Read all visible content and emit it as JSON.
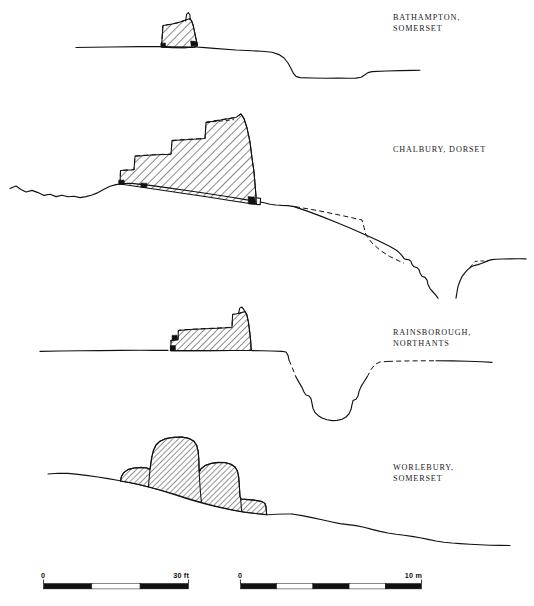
{
  "figure": {
    "type": "archaeological-cross-sections",
    "title_visible": false,
    "background_color": "#ffffff",
    "ink_color": "#111111"
  },
  "sections": [
    {
      "id": "bathampton",
      "label_line1": "BATHAMPTON,",
      "label_line2": "SOMERSET",
      "rampart_style": "trapezoidal-hatched",
      "has_dashed_reconstruction": true,
      "has_ditch": true,
      "ditch_style": "broad-flat-bottomed"
    },
    {
      "id": "chalbury",
      "label_line1": "CHALBURY, DORSET",
      "label_line2": "",
      "rampart_style": "stepped-hatched-four-levels",
      "has_dashed_reconstruction": true,
      "has_ditch": true,
      "ditch_style": "deep-v-on-slope"
    },
    {
      "id": "rainsborough",
      "label_line1": "RAINSBOROUGH,",
      "label_line2": "NORTHANTS",
      "rampart_style": "stepped-hatched",
      "has_dashed_reconstruction": true,
      "has_ditch": true,
      "ditch_style": "deep-v-narrow"
    },
    {
      "id": "worlebury",
      "label_line1": "WORLEBURY,",
      "label_line2": "SOMERSET",
      "rampart_style": "multi-lobed-hatched",
      "has_dashed_reconstruction": false,
      "has_ditch": false,
      "ditch_style": ""
    }
  ],
  "scales": [
    {
      "id": "feet",
      "start_label": "0",
      "end_label": "30 ft",
      "unit": "ft",
      "max_value": 30,
      "segments": 3
    },
    {
      "id": "metres",
      "start_label": "0",
      "end_label": "10 m",
      "unit": "m",
      "max_value": 10,
      "segments": 5
    }
  ]
}
